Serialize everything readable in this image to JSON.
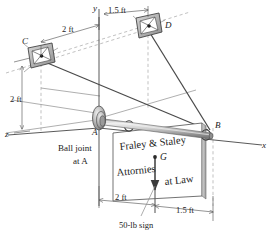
{
  "figure": {
    "type": "engineering-statics-free-body-diagram"
  },
  "axes": {
    "x_label": "x",
    "y_label": "y",
    "z_label": "z"
  },
  "points": {
    "a_label": "A",
    "b_label": "B",
    "c_label": "C",
    "d_label": "D",
    "g_label": "G"
  },
  "annotations": {
    "ball_joint_line1": "Ball joint",
    "ball_joint_line2": "at A",
    "sign_weight": "50-lb sign"
  },
  "dimensions": {
    "top_2ft": "2 ft",
    "top_1_5ft": "1.5 ft",
    "left_2ft": "2 ft",
    "bottom_2ft": "2 ft",
    "bottom_1_5ft": "1.5 ft"
  },
  "sign": {
    "line1": "Fraley & Staley",
    "line2": "Attornies",
    "line3": "at Law"
  },
  "colors": {
    "line": "#3b3b3b",
    "thin_line": "#6f6f6f",
    "dashed": "#9a9a9a",
    "boom_light": "#e3e3e3",
    "boom_mid": "#b9b9b9",
    "boom_dark": "#8a8a8a",
    "bracket_fill": "#c9c9c9",
    "bracket_edge": "#4a4a4a",
    "sign_face": "#ffffff",
    "sign_edge": "#555555",
    "text": "#222222"
  }
}
